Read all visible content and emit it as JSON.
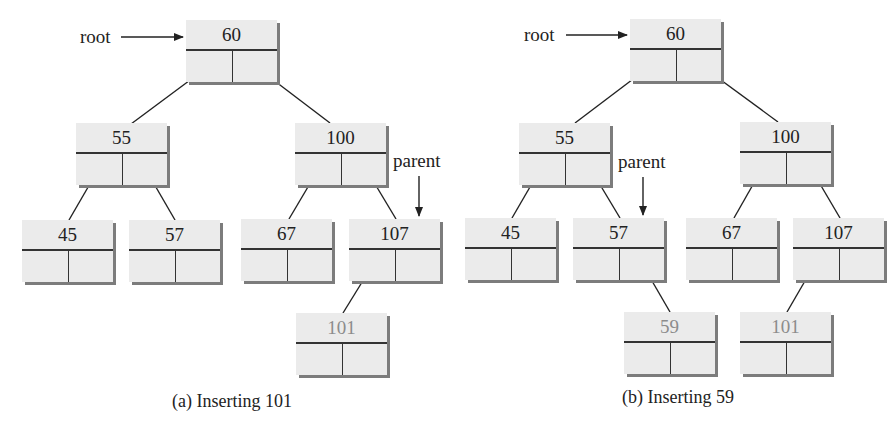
{
  "panel_a": {
    "caption": "(a) Inserting 101",
    "root_label": "root",
    "parent_label": "parent",
    "nodes": {
      "n60": "60",
      "n55": "55",
      "n100": "100",
      "n45": "45",
      "n57": "57",
      "n67": "67",
      "n107": "107",
      "n101": "101"
    },
    "inserted_value": "101"
  },
  "panel_b": {
    "caption": "(b) Inserting 59",
    "root_label": "root",
    "parent_label": "parent",
    "nodes": {
      "n60": "60",
      "n55": "55",
      "n100": "100",
      "n45": "45",
      "n57": "57",
      "n67": "67",
      "n107": "107",
      "n59": "59",
      "n101": "101"
    },
    "inserted_value": "59"
  },
  "colors": {
    "node_fill": "#ebebeb",
    "node_shadow": "#7c7c7c",
    "inserted_text": "#8c8c8c",
    "line": "#222222"
  }
}
